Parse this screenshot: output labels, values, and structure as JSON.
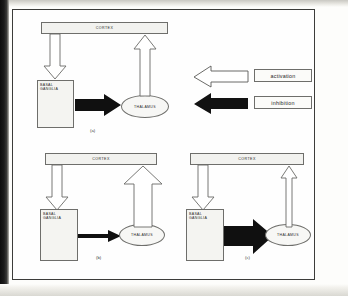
{
  "figure": {
    "caption_labels": [
      "(a)",
      "(b)",
      "(c)"
    ],
    "node_labels": {
      "cortex": "CORTEX",
      "basal_ganglia_line1": "BASAL",
      "basal_ganglia_line2": "GANGLIA",
      "thalamus": "THALAMUS"
    },
    "legend": {
      "activation": {
        "label": "activation",
        "arrow_style": "outline",
        "arrow_color": "#ffffff",
        "arrow_outline_color": "#5a5a57",
        "direction": "left"
      },
      "inhibition": {
        "label": "inhibition",
        "arrow_style": "filled",
        "arrow_color": "#121212",
        "arrow_outline_color": "#121212",
        "direction": "left"
      }
    },
    "panels": [
      {
        "id": "a",
        "label": "(a)",
        "cortex_to_basal_ganglia": {
          "type": "activation",
          "style": "outline",
          "weight": "normal"
        },
        "basal_ganglia_to_thalamus": {
          "type": "inhibition",
          "style": "filled",
          "weight": "normal"
        },
        "thalamus_to_cortex": {
          "type": "activation",
          "style": "outline",
          "weight": "normal"
        }
      },
      {
        "id": "b",
        "label": "(b)",
        "cortex_to_basal_ganglia": {
          "type": "activation",
          "style": "outline",
          "weight": "normal"
        },
        "basal_ganglia_to_thalamus": {
          "type": "inhibition",
          "style": "filled",
          "weight": "thin"
        },
        "thalamus_to_cortex": {
          "type": "activation",
          "style": "outline",
          "weight": "thick"
        }
      },
      {
        "id": "c",
        "label": "(c)",
        "cortex_to_basal_ganglia": {
          "type": "activation",
          "style": "outline",
          "weight": "normal"
        },
        "basal_ganglia_to_thalamus": {
          "type": "inhibition",
          "style": "filled",
          "weight": "thick"
        },
        "thalamus_to_cortex": {
          "type": "activation",
          "style": "outline",
          "weight": "thin"
        }
      }
    ],
    "colors": {
      "frame_border": "#3c3c3a",
      "node_fill": "#f2f2ef",
      "node_border": "#6e6e6b",
      "page_background": "#fdfdfb"
    }
  }
}
